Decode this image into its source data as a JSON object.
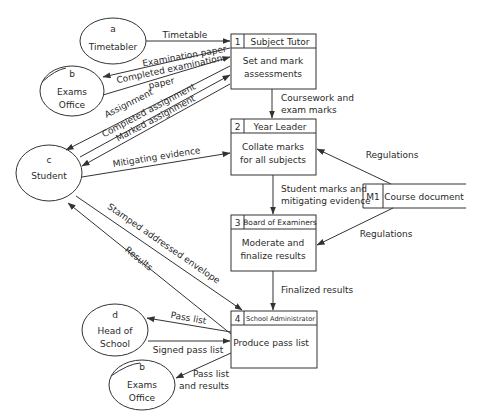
{
  "diagram": {
    "type": "data-flow-diagram",
    "external_entities": [
      {
        "id": "a",
        "letter": "a",
        "label": "Timetabler"
      },
      {
        "id": "b1",
        "letter": "b",
        "label_line1": "Exams",
        "label_line2": "Office"
      },
      {
        "id": "c",
        "letter": "c",
        "label": "Student"
      },
      {
        "id": "d",
        "letter": "d",
        "label_line1": "Head of",
        "label_line2": "School"
      },
      {
        "id": "b2",
        "letter": "b",
        "label_line1": "Exams",
        "label_line2": "Office"
      }
    ],
    "processes": [
      {
        "number": "1",
        "actor": "Subject Tutor",
        "line1": "Set and mark",
        "line2": "assessments"
      },
      {
        "number": "2",
        "actor": "Year Leader",
        "line1": "Collate marks",
        "line2": "for all subjects"
      },
      {
        "number": "3",
        "actor": "Board of Examiners",
        "line1": "Moderate and",
        "line2": "finalize results"
      },
      {
        "number": "4",
        "actor": "School Administrator",
        "line1": "Produce pass list"
      }
    ],
    "data_store": {
      "id": "M1",
      "label": "Course document"
    },
    "flows": {
      "timetable": "Timetable",
      "exam_paper": "Examination paper",
      "completed_exam_1": "Completed examination",
      "completed_exam_2": "paper",
      "assignment": "Assignment",
      "completed_assignment": "Completed assignment",
      "marked_assignment": "Marked assignment",
      "mitigating": "Mitigating evidence",
      "coursework_1": "Coursework and",
      "coursework_2": "exam marks",
      "student_marks_1": "Student marks and",
      "student_marks_2": "mitigating evidence",
      "regulations_1": "Regulations",
      "regulations_2": "Regulations",
      "sae": "Stamped addressed envelope",
      "results": "Results",
      "finalized": "Finalized results",
      "pass_list": "Pass list",
      "signed_pass_list": "Signed pass list",
      "pass_results_1": "Pass list",
      "pass_results_2": "and  results"
    }
  }
}
